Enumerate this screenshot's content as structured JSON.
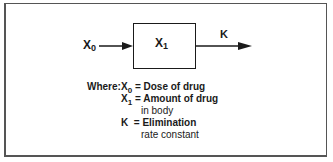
{
  "diagram": {
    "input_label": "X",
    "input_sub": "0",
    "compartment_label": "X",
    "compartment_sub": "1",
    "output_label": "K"
  },
  "legend": {
    "where": "Where:",
    "rows": [
      {
        "sym": "X",
        "sub": "0",
        "eq": "=",
        "text": "Dose of drug",
        "cont": ""
      },
      {
        "sym": "X",
        "sub": "1",
        "eq": "=",
        "text": "Amount of drug",
        "cont": "in body"
      },
      {
        "sym": "K",
        "sub": "",
        "eq": "=",
        "text": "Elimination",
        "cont": "rate constant"
      }
    ]
  },
  "colors": {
    "ink": "#1a1a1a",
    "frame": "#555555",
    "background": "#ffffff"
  }
}
